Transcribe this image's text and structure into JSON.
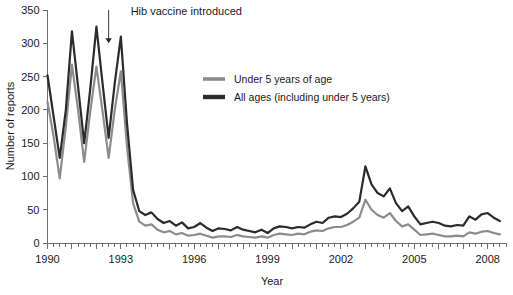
{
  "chart_data": {
    "type": "line",
    "title": "",
    "xlabel": "Year",
    "ylabel": "Number of reports",
    "xlim": [
      1990,
      2008.75
    ],
    "ylim": [
      0,
      350
    ],
    "yticks": [
      0,
      50,
      100,
      150,
      200,
      250,
      300,
      350
    ],
    "xticks": [
      1990,
      1993,
      1996,
      1999,
      2002,
      2005,
      2008
    ],
    "xtick_labels": [
      "1990",
      "1993",
      "1996",
      "1999",
      "2002",
      "2005",
      "2008"
    ],
    "ytick_labels": [
      "0",
      "50",
      "100",
      "150",
      "200",
      "250",
      "300",
      "350"
    ],
    "x_minor_tick_interval": 0.25,
    "grid": false,
    "legend_position": "upper-center-right",
    "annotations": [
      {
        "text": "Hib vaccine introduced",
        "arrow_x": 1992.5,
        "arrow_y_top": 350,
        "arrow_y_tip": 300
      }
    ],
    "x": [
      1990.0,
      1990.25,
      1990.5,
      1990.75,
      1991.0,
      1991.25,
      1991.5,
      1991.75,
      1992.0,
      1992.25,
      1992.5,
      1992.75,
      1993.0,
      1993.25,
      1993.5,
      1993.75,
      1994.0,
      1994.25,
      1994.5,
      1994.75,
      1995.0,
      1995.25,
      1995.5,
      1995.75,
      1996.0,
      1996.25,
      1996.5,
      1996.75,
      1997.0,
      1997.25,
      1997.5,
      1997.75,
      1998.0,
      1998.25,
      1998.5,
      1998.75,
      1999.0,
      1999.25,
      1999.5,
      1999.75,
      2000.0,
      2000.25,
      2000.5,
      2000.75,
      2001.0,
      2001.25,
      2001.5,
      2001.75,
      2002.0,
      2002.25,
      2002.5,
      2002.75,
      2003.0,
      2003.25,
      2003.5,
      2003.75,
      2004.0,
      2004.25,
      2004.5,
      2004.75,
      2005.0,
      2005.25,
      2005.5,
      2005.75,
      2006.0,
      2006.25,
      2006.5,
      2006.75,
      2007.0,
      2007.25,
      2007.5,
      2007.75,
      2008.0,
      2008.25,
      2008.5
    ],
    "series": [
      {
        "name": "All ages (including under 5 years)",
        "color": "#2b2b2b",
        "linewidth": 2.2,
        "values": [
          252,
          190,
          128,
          200,
          318,
          235,
          150,
          232,
          325,
          240,
          158,
          240,
          310,
          180,
          80,
          48,
          42,
          46,
          36,
          30,
          33,
          26,
          31,
          22,
          24,
          30,
          23,
          18,
          22,
          21,
          19,
          24,
          20,
          18,
          16,
          20,
          15,
          22,
          25,
          24,
          22,
          24,
          23,
          28,
          32,
          30,
          38,
          40,
          39,
          44,
          52,
          62,
          115,
          88,
          75,
          70,
          82,
          60,
          48,
          55,
          40,
          28,
          30,
          32,
          30,
          26,
          25,
          27,
          26,
          40,
          35,
          43,
          45,
          38,
          33
        ]
      },
      {
        "name": "Under 5 years of age",
        "color": "#8c8c8c",
        "linewidth": 2.2,
        "values": [
          212,
          160,
          97,
          175,
          268,
          200,
          122,
          198,
          265,
          198,
          128,
          200,
          258,
          145,
          60,
          32,
          26,
          28,
          20,
          16,
          18,
          13,
          15,
          11,
          12,
          14,
          11,
          8,
          10,
          10,
          9,
          12,
          10,
          9,
          8,
          10,
          8,
          12,
          14,
          13,
          12,
          14,
          13,
          17,
          19,
          18,
          22,
          24,
          24,
          27,
          32,
          38,
          65,
          50,
          42,
          38,
          45,
          33,
          25,
          28,
          20,
          12,
          13,
          14,
          12,
          10,
          10,
          11,
          10,
          16,
          14,
          17,
          18,
          15,
          13
        ]
      }
    ],
    "legend": [
      {
        "label": "Under 5 years of age",
        "color": "#8c8c8c"
      },
      {
        "label": "All ages (including under 5 years)",
        "color": "#2b2b2b"
      }
    ]
  }
}
